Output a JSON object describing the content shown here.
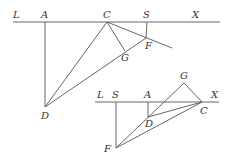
{
  "figure1": {
    "labels": {
      "L": "L",
      "A": "A",
      "C": "C",
      "S": "S",
      "X": "X",
      "F": "F",
      "G": "G",
      "D": "D"
    }
  },
  "figure2": {
    "labels": {
      "L": "L",
      "S": "S",
      "A": "A",
      "X": "X",
      "G": "G",
      "C": "C",
      "D": "D",
      "F": "F"
    }
  }
}
